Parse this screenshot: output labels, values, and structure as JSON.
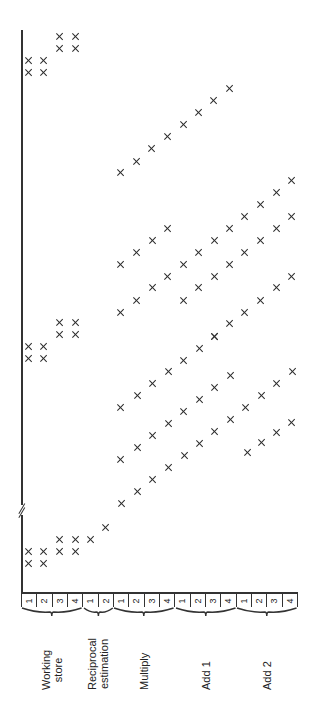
{
  "figure": {
    "orientation": "rotated-90-ccw",
    "time_axis_break": true
  },
  "groups": [
    {
      "name": "Working store",
      "label_lines": [
        "Working",
        "store"
      ],
      "stages": [
        "1",
        "2",
        "3",
        "4"
      ]
    },
    {
      "name": "Reciprocal estimation",
      "label_lines": [
        "Reciprocal",
        "estimation"
      ],
      "stages": [
        "1",
        "2"
      ]
    },
    {
      "name": "Multiply",
      "label_lines": [
        "Multiply"
      ],
      "stages": [
        "1",
        "2",
        "3",
        "4"
      ]
    },
    {
      "name": "Add 1",
      "label_lines": [
        "Add 1"
      ],
      "stages": [
        "1",
        "2",
        "3",
        "4"
      ]
    },
    {
      "name": "Add 2",
      "label_lines": [
        "Add 2"
      ],
      "stages": [
        "1",
        "2",
        "3",
        "4"
      ]
    }
  ],
  "ticks": [
    "1",
    "2",
    "3",
    "4",
    "1",
    "2",
    "1",
    "2",
    "3",
    "4",
    "1",
    "2",
    "3",
    "4",
    "1",
    "2",
    "3",
    "4"
  ],
  "marks": [
    [
      28,
      563
    ],
    [
      43,
      563
    ],
    [
      28,
      551
    ],
    [
      43,
      551
    ],
    [
      59,
      551
    ],
    [
      75,
      551
    ],
    [
      59,
      539
    ],
    [
      75,
      539
    ],
    [
      90,
      539
    ],
    [
      105,
      527
    ],
    [
      121,
      503
    ],
    [
      137,
      491
    ],
    [
      152,
      479
    ],
    [
      168,
      467
    ],
    [
      184,
      455
    ],
    [
      199,
      443
    ],
    [
      214,
      431
    ],
    [
      230,
      419
    ],
    [
      245,
      407
    ],
    [
      261,
      395
    ],
    [
      276,
      383
    ],
    [
      292,
      371
    ],
    [
      120,
      459
    ],
    [
      137,
      447
    ],
    [
      152,
      435
    ],
    [
      168,
      423
    ],
    [
      183,
      411
    ],
    [
      199,
      399
    ],
    [
      214,
      387
    ],
    [
      230,
      375
    ],
    [
      247,
      452
    ],
    [
      261,
      442
    ],
    [
      276,
      432
    ],
    [
      291,
      422
    ],
    [
      120,
      407
    ],
    [
      137,
      395
    ],
    [
      152,
      383
    ],
    [
      168,
      371
    ],
    [
      183,
      360
    ],
    [
      199,
      348
    ],
    [
      214,
      336
    ],
    [
      28,
      358
    ],
    [
      43,
      358
    ],
    [
      28,
      346
    ],
    [
      43,
      346
    ],
    [
      59,
      334
    ],
    [
      75,
      334
    ],
    [
      59,
      322
    ],
    [
      75,
      322
    ],
    [
      120,
      312
    ],
    [
      136,
      300
    ],
    [
      152,
      287
    ],
    [
      167,
      276
    ],
    [
      183,
      264
    ],
    [
      198,
      252
    ],
    [
      214,
      240
    ],
    [
      229,
      228
    ],
    [
      244,
      216
    ],
    [
      260,
      204
    ],
    [
      276,
      192
    ],
    [
      291,
      180
    ],
    [
      120,
      264
    ],
    [
      136,
      252
    ],
    [
      152,
      240
    ],
    [
      167,
      228
    ],
    [
      183,
      300
    ],
    [
      198,
      287
    ],
    [
      214,
      276
    ],
    [
      229,
      264
    ],
    [
      244,
      252
    ],
    [
      260,
      240
    ],
    [
      276,
      228
    ],
    [
      291,
      216
    ],
    [
      214,
      336
    ],
    [
      229,
      323
    ],
    [
      244,
      312
    ],
    [
      260,
      300
    ],
    [
      276,
      287
    ],
    [
      291,
      276
    ],
    [
      120,
      172
    ],
    [
      136,
      161
    ],
    [
      151,
      148
    ],
    [
      167,
      136
    ],
    [
      183,
      124
    ],
    [
      198,
      112
    ],
    [
      213,
      100
    ],
    [
      229,
      88
    ],
    [
      28,
      72
    ],
    [
      43,
      72
    ],
    [
      28,
      60
    ],
    [
      43,
      60
    ],
    [
      59,
      48
    ],
    [
      75,
      48
    ],
    [
      59,
      36
    ],
    [
      75,
      36
    ]
  ]
}
